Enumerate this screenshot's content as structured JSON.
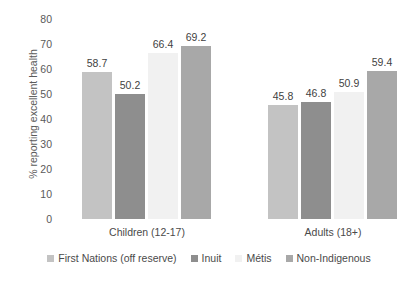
{
  "chart_data": {
    "type": "bar",
    "title": "",
    "subtitle": "",
    "xlabel": "",
    "ylabel": "% reporting excellent health",
    "ylim": [
      0,
      80
    ],
    "yticks": [
      80,
      70,
      60,
      50,
      40,
      30,
      20,
      10,
      0
    ],
    "grid": false,
    "legend_position": "bottom",
    "categories": [
      "Children (12-17)",
      "Adults (18+)"
    ],
    "series": [
      {
        "name": "First Nations (off reserve)",
        "color": "#c3c3c3",
        "values": [
          58.7,
          45.8
        ]
      },
      {
        "name": "Inuit",
        "color": "#8e8e8e",
        "values": [
          50.2,
          46.8
        ]
      },
      {
        "name": "Métis",
        "color": "#f1f1f1",
        "values": [
          66.4,
          50.9
        ]
      },
      {
        "name": "Non-Indigenous",
        "color": "#a8a8a8",
        "values": [
          69.2,
          59.4
        ]
      }
    ],
    "data_labels": [
      [
        "58.7",
        "50.2",
        "66.4",
        "69.2"
      ],
      [
        "45.8",
        "46.8",
        "50.9",
        "59.4"
      ]
    ]
  }
}
